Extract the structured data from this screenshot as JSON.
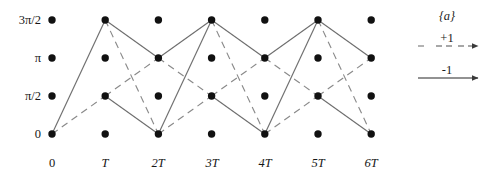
{
  "figure": {
    "title": ""
  },
  "axes": {
    "y_labels": [
      "3π/2",
      "π",
      "π/2",
      "0"
    ],
    "x_labels": [
      "0",
      "T",
      "2T",
      "3T",
      "4T",
      "5T",
      "6T"
    ],
    "y_values": [
      4.712,
      3.142,
      1.571,
      0
    ],
    "x_values": [
      0,
      1,
      2,
      3,
      4,
      5,
      6
    ]
  },
  "legend": {
    "title": "{a}",
    "entries": [
      {
        "value": "+1",
        "style": "dashed"
      },
      {
        "value": "-1",
        "style": "solid"
      }
    ]
  },
  "chart_data": {
    "type": "diagram",
    "title": "",
    "xlabel": "",
    "ylabel": "",
    "x_ticks": [
      "0",
      "T",
      "2T",
      "3T",
      "4T",
      "5T",
      "6T"
    ],
    "y_ticks": [
      "0",
      "π/2",
      "π",
      "3π/2"
    ],
    "xlim": [
      0,
      6
    ],
    "ylim": [
      0,
      3
    ],
    "grid": false,
    "legend_position": "right",
    "nodes": [
      {
        "x": 0,
        "y": 0
      },
      {
        "x": 0,
        "y": 1
      },
      {
        "x": 0,
        "y": 2
      },
      {
        "x": 0,
        "y": 3
      },
      {
        "x": 1,
        "y": 0
      },
      {
        "x": 1,
        "y": 1
      },
      {
        "x": 1,
        "y": 2
      },
      {
        "x": 1,
        "y": 3
      },
      {
        "x": 2,
        "y": 0
      },
      {
        "x": 2,
        "y": 1
      },
      {
        "x": 2,
        "y": 2
      },
      {
        "x": 2,
        "y": 3
      },
      {
        "x": 3,
        "y": 0
      },
      {
        "x": 3,
        "y": 1
      },
      {
        "x": 3,
        "y": 2
      },
      {
        "x": 3,
        "y": 3
      },
      {
        "x": 4,
        "y": 0
      },
      {
        "x": 4,
        "y": 1
      },
      {
        "x": 4,
        "y": 2
      },
      {
        "x": 4,
        "y": 3
      },
      {
        "x": 5,
        "y": 0
      },
      {
        "x": 5,
        "y": 1
      },
      {
        "x": 5,
        "y": 2
      },
      {
        "x": 5,
        "y": 3
      },
      {
        "x": 6,
        "y": 0
      },
      {
        "x": 6,
        "y": 1
      },
      {
        "x": 6,
        "y": 2
      },
      {
        "x": 6,
        "y": 3
      }
    ],
    "branches": [
      {
        "x1": 0,
        "y1": 0,
        "x2": 1,
        "y2": 3,
        "style": "solid"
      },
      {
        "x1": 0,
        "y1": 0,
        "x2": 1,
        "y2": 1,
        "style": "dashed"
      },
      {
        "x1": 1,
        "y1": 3,
        "x2": 2,
        "y2": 2,
        "style": "solid"
      },
      {
        "x1": 1,
        "y1": 3,
        "x2": 2,
        "y2": 0,
        "style": "dashed"
      },
      {
        "x1": 1,
        "y1": 1,
        "x2": 2,
        "y2": 0,
        "style": "solid"
      },
      {
        "x1": 1,
        "y1": 1,
        "x2": 2,
        "y2": 2,
        "style": "dashed"
      },
      {
        "x1": 2,
        "y1": 2,
        "x2": 3,
        "y2": 3,
        "style": "solid"
      },
      {
        "x1": 2,
        "y1": 2,
        "x2": 3,
        "y2": 1,
        "style": "dashed"
      },
      {
        "x1": 2,
        "y1": 0,
        "x2": 3,
        "y2": 3,
        "style": "solid"
      },
      {
        "x1": 2,
        "y1": 0,
        "x2": 3,
        "y2": 1,
        "style": "dashed"
      },
      {
        "x1": 3,
        "y1": 3,
        "x2": 4,
        "y2": 2,
        "style": "solid"
      },
      {
        "x1": 3,
        "y1": 3,
        "x2": 4,
        "y2": 0,
        "style": "dashed"
      },
      {
        "x1": 3,
        "y1": 1,
        "x2": 4,
        "y2": 0,
        "style": "solid"
      },
      {
        "x1": 3,
        "y1": 1,
        "x2": 4,
        "y2": 2,
        "style": "dashed"
      },
      {
        "x1": 4,
        "y1": 2,
        "x2": 5,
        "y2": 3,
        "style": "solid"
      },
      {
        "x1": 4,
        "y1": 2,
        "x2": 5,
        "y2": 1,
        "style": "dashed"
      },
      {
        "x1": 4,
        "y1": 0,
        "x2": 5,
        "y2": 3,
        "style": "solid"
      },
      {
        "x1": 4,
        "y1": 0,
        "x2": 5,
        "y2": 1,
        "style": "dashed"
      },
      {
        "x1": 5,
        "y1": 3,
        "x2": 6,
        "y2": 2,
        "style": "solid"
      },
      {
        "x1": 5,
        "y1": 3,
        "x2": 6,
        "y2": 0,
        "style": "dashed"
      },
      {
        "x1": 5,
        "y1": 1,
        "x2": 6,
        "y2": 0,
        "style": "solid"
      },
      {
        "x1": 5,
        "y1": 1,
        "x2": 6,
        "y2": 2,
        "style": "dashed"
      }
    ],
    "colors": {
      "node": "#111111",
      "solid_branch": "#6e6e6e",
      "dashed_branch": "#8a8a8a",
      "text": "#161616"
    }
  }
}
